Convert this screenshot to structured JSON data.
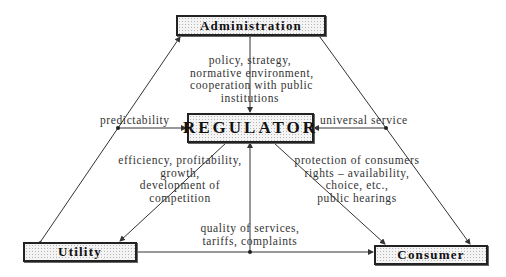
{
  "diagram": {
    "type": "relationship-diagram",
    "nodes": {
      "administration": "Administration",
      "regulator": "REGULATOR",
      "utility": "Utility",
      "consumer": "Consumer"
    },
    "edge_labels": {
      "admin_to_regulator": [
        "policy, strategy,",
        "normative environment,",
        "cooperation with public",
        "institutions"
      ],
      "predictability": "predictability",
      "universal_service": "universal service",
      "regulator_to_utility": [
        "efficiency, profitability,",
        "growth,",
        "development of",
        "competition"
      ],
      "regulator_to_consumer": [
        "protection of consumers",
        "rights – availability,",
        "choice, etc.,",
        "public hearings"
      ],
      "utility_consumer": [
        "quality of services,",
        "tariffs, complaints"
      ]
    },
    "colors": {
      "line": "#333333",
      "box_border": "#222222",
      "box_fill": "#f4f4f4"
    }
  }
}
